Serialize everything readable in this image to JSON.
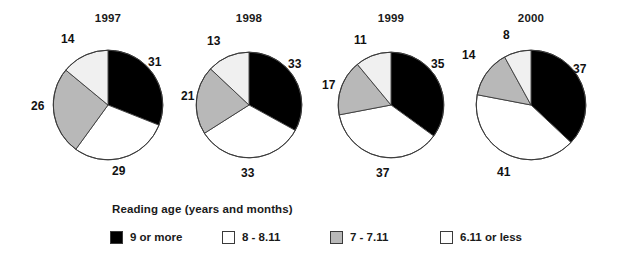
{
  "chart_data": {
    "type": "pie",
    "title": "",
    "legend_title": "Reading age (years and months)",
    "legend_position": "bottom",
    "series_names": [
      "9 or more",
      "8 - 8.11",
      "7 - 7.11",
      "6.11 or less"
    ],
    "series_colors": [
      "#000000",
      "#ffffff",
      "#b8b8b8",
      "#f0f0f0"
    ],
    "unit": "%",
    "charts": [
      {
        "title": "1997",
        "categories": [
          "9 or more",
          "8 - 8.11",
          "7 - 7.11",
          "6.11 or less"
        ],
        "values": [
          31,
          29,
          26,
          14
        ],
        "labels": [
          "31",
          "29",
          "26",
          "14"
        ]
      },
      {
        "title": "1998",
        "categories": [
          "9 or more",
          "8 - 8.11",
          "7 - 7.11",
          "6.11 or less"
        ],
        "values": [
          33,
          33,
          21,
          13
        ],
        "labels": [
          "33",
          "33",
          "21",
          "13"
        ]
      },
      {
        "title": "1999",
        "categories": [
          "9 or more",
          "8 - 8.11",
          "7 - 7.11",
          "6.11 or less"
        ],
        "values": [
          35,
          37,
          17,
          11
        ],
        "labels": [
          "35",
          "37",
          "17",
          "11"
        ]
      },
      {
        "title": "2000",
        "categories": [
          "9 or more",
          "8 - 8.11",
          "7 - 7.11",
          "6.11 or less"
        ],
        "values": [
          37,
          41,
          14,
          8
        ],
        "labels": [
          "37",
          "41",
          "14",
          "8"
        ]
      }
    ]
  },
  "figure": {
    "background": "#ffffff",
    "outline_color": "#3a3a3a",
    "pies": [
      {
        "year": "1997",
        "left": 44,
        "width": 128,
        "radius": 55
      },
      {
        "year": "1998",
        "left": 190,
        "width": 118,
        "radius": 53
      },
      {
        "year": "1999",
        "left": 332,
        "width": 118,
        "radius": 53
      },
      {
        "year": "2000",
        "left": 470,
        "width": 122,
        "radius": 55
      }
    ]
  },
  "legend": {
    "title": "Reading age (years and months)",
    "items": [
      {
        "label": "9 or more",
        "color": "#000000",
        "left": 0
      },
      {
        "label": "8 - 8.11",
        "color": "#ffffff",
        "left": 112
      },
      {
        "label": "7 - 7.11",
        "color": "#b8b8b8",
        "left": 220
      },
      {
        "label": "6.11 or less",
        "color": "#fdfdfd",
        "left": 330
      }
    ]
  }
}
